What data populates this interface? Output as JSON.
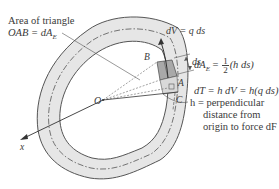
{
  "diagram": {
    "labels": {
      "area_triangle_line1": "Area of triangle",
      "area_triangle_line2": "OAB = dA",
      "area_triangle_sub": "E",
      "dV": "dV = q ds",
      "ds": "ds",
      "B": "B",
      "A": "A",
      "C": "C",
      "O": "O",
      "x": "x",
      "h_line1": "h = perpendicular",
      "h_line2": "distance from",
      "h_line3": "origin to force dF"
    },
    "equations": {
      "dAE_left": "dA",
      "dAE_sub": "E",
      "dAE_eq": " = ",
      "frac_num": "1",
      "frac_den": "2",
      "dAE_right": "(h ds)",
      "dT": "dT = h dV = h(q ds)"
    },
    "colors": {
      "wall_fill": "#e6e6e6",
      "element_fill": "#a9a9a9",
      "outline": "#555555",
      "text": "#3a3a3a"
    }
  }
}
